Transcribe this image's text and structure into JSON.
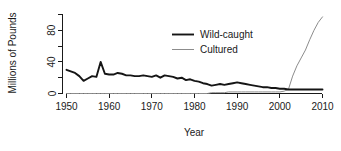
{
  "chart_data": {
    "type": "line",
    "title": "",
    "xlabel": "Year",
    "ylabel": "Millions of Pounds",
    "xlim": [
      1950,
      2010
    ],
    "ylim": [
      0,
      100
    ],
    "xticks": [
      1950,
      1960,
      1970,
      1980,
      1990,
      2000,
      2010
    ],
    "xticklabels": [
      "1950",
      "1960",
      "1970",
      "1980",
      "1990",
      "2000",
      "2010"
    ],
    "yticks": [
      0,
      20,
      40,
      60,
      80,
      100
    ],
    "yticklabels": [
      "0",
      "",
      "40",
      "",
      "80",
      ""
    ],
    "grid": false,
    "legend_position": "upper-center-left",
    "x": [
      1950,
      1951,
      1952,
      1953,
      1954,
      1955,
      1956,
      1957,
      1958,
      1959,
      1960,
      1961,
      1962,
      1963,
      1964,
      1965,
      1966,
      1967,
      1968,
      1969,
      1970,
      1971,
      1972,
      1973,
      1974,
      1975,
      1976,
      1977,
      1978,
      1979,
      1980,
      1981,
      1982,
      1983,
      1984,
      1985,
      1986,
      1987,
      1988,
      1989,
      1990,
      1991,
      1992,
      1993,
      1994,
      1995,
      1996,
      1997,
      1998,
      1999,
      2000,
      2001,
      2002,
      2003,
      2004,
      2005,
      2006,
      2007,
      2008,
      2009,
      2010
    ],
    "series": [
      {
        "name": "Wild-caught",
        "color": "#151515",
        "linewidth": "thick",
        "values": [
          30,
          28,
          26,
          22,
          16,
          19,
          22,
          21,
          40,
          25,
          24,
          24,
          26,
          25,
          23,
          23,
          22,
          22,
          23,
          22,
          21,
          23,
          20,
          23,
          22,
          21,
          19,
          20,
          17,
          18,
          16,
          15,
          13,
          12,
          10,
          11,
          12,
          11,
          12,
          13,
          14,
          13,
          12,
          11,
          10,
          9,
          8,
          8,
          7,
          7,
          6,
          6,
          5,
          5,
          5,
          5,
          5,
          5,
          5,
          5,
          5
        ]
      },
      {
        "name": "Cultured",
        "color": "#8c8c8c",
        "linewidth": "thin",
        "values": [
          0,
          0,
          0,
          0,
          0,
          0,
          0,
          0,
          0,
          0,
          0,
          0,
          0,
          0,
          0,
          0,
          0,
          0,
          0,
          0,
          0,
          0,
          0,
          0,
          0,
          0,
          0,
          0,
          0,
          0,
          0,
          0,
          0,
          0,
          1,
          1,
          1,
          1,
          2,
          2,
          2,
          2,
          2,
          2,
          2,
          2,
          2,
          2,
          2,
          2,
          2,
          3,
          5,
          22,
          35,
          45,
          55,
          68,
          80,
          90,
          97
        ]
      }
    ],
    "legend": [
      {
        "label": "Wild-caught",
        "color": "#151515"
      },
      {
        "label": "Cultured",
        "color": "#8c8c8c"
      }
    ]
  }
}
